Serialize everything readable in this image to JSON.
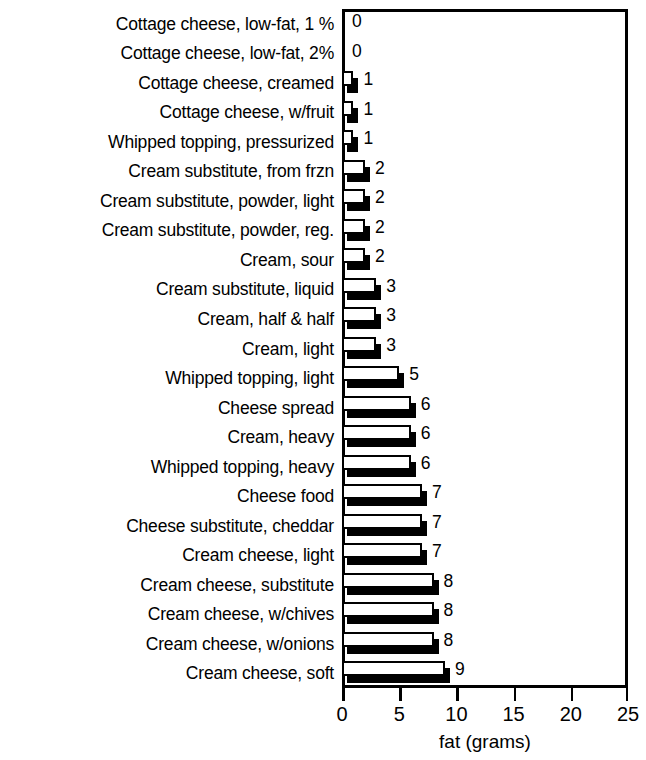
{
  "chart_data": {
    "type": "bar",
    "orientation": "horizontal",
    "title": "",
    "xlabel": "fat (grams)",
    "ylabel": "",
    "xlim": [
      0,
      25
    ],
    "xticks": [
      0,
      5,
      10,
      15,
      20,
      25
    ],
    "xtick_labels": [
      "0",
      "5",
      "10",
      "15",
      "20",
      "25"
    ],
    "grid": false,
    "legend": null,
    "value_labels_shown": true,
    "categories": [
      "Cottage cheese, low-fat, 1 %",
      "Cottage cheese, low-fat, 2%",
      "Cottage cheese, creamed",
      "Cottage cheese, w/fruit",
      "Whipped topping, pressurized",
      "Cream substitute, from frzn",
      "Cream substitute, powder, light",
      "Cream substitute, powder, reg.",
      "Cream, sour",
      "Cream substitute, liquid",
      "Cream, half & half",
      "Cream, light",
      "Whipped topping, light",
      "Cheese spread",
      "Cream, heavy",
      "Whipped topping, heavy",
      "Cheese food",
      "Cheese substitute, cheddar",
      "Cream cheese, light",
      "Cream cheese, substitute",
      "Cream cheese, w/chives",
      "Cream cheese, w/onions",
      "Cream cheese, soft"
    ],
    "values": [
      0,
      0,
      1,
      1,
      1,
      2,
      2,
      2,
      2,
      3,
      3,
      3,
      5,
      6,
      6,
      6,
      7,
      7,
      7,
      8,
      8,
      8,
      9
    ],
    "value_labels": [
      "0",
      "0",
      "1",
      "1",
      "1",
      "2",
      "2",
      "2",
      "2",
      "3",
      "3",
      "3",
      "5",
      "6",
      "6",
      "6",
      "7",
      "7",
      "7",
      "8",
      "8",
      "8",
      "9"
    ]
  },
  "style": {
    "bar_face_color": "#ffffff",
    "bar_edge_color": "#000000",
    "bar_shadow_color": "#000000",
    "axis_color": "#000000",
    "background_color": "#ffffff",
    "text_color": "#000000"
  }
}
